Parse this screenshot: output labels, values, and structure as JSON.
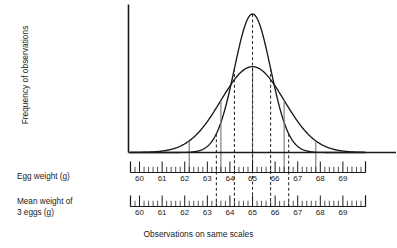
{
  "chart_data": {
    "type": "line",
    "title": "",
    "xlabel": "Observations on same scales",
    "ylabel": "Frequency of observations",
    "grid": false,
    "legend": "none",
    "xlim": [
      59.6,
      70.0
    ],
    "ylim": [
      0,
      1
    ],
    "axes": [
      {
        "name": "egg-weight-axis",
        "label": "Egg weight (g)",
        "tick_labels": [
          "60",
          "61",
          "62",
          "63",
          "64",
          "65",
          "66",
          "67",
          "68",
          "69"
        ],
        "tick_values": [
          60,
          61,
          62,
          63,
          64,
          65,
          66,
          67,
          68,
          69
        ],
        "minor_ticks_per_unit": 5,
        "range": [
          59.6,
          70.0
        ]
      },
      {
        "name": "mean-weight-axis",
        "label": "Mean weight of\n3 eggs (g)",
        "tick_labels": [
          "60",
          "61",
          "62",
          "63",
          "64",
          "65",
          "66",
          "67",
          "68",
          "69"
        ],
        "tick_values": [
          60,
          61,
          62,
          63,
          64,
          65,
          66,
          67,
          68,
          69
        ],
        "minor_ticks_per_unit": 5,
        "range": [
          59.6,
          70.0
        ]
      }
    ],
    "series": [
      {
        "name": "Distribution of individual egg weights",
        "style": "solid",
        "mean": 65.0,
        "sd": 1.4,
        "peak_height": 0.62,
        "note": "wider flatter normal curve"
      },
      {
        "name": "Distribution of mean weight of 3 eggs",
        "style": "solid",
        "mean": 65.0,
        "sd": 0.8,
        "peak_height": 1.0,
        "note": "narrower taller normal curve"
      }
    ],
    "reference_lines": [
      {
        "name": "egg-minus-2sd",
        "value": 62.2,
        "style": "solid",
        "color": "#7a7a7a"
      },
      {
        "name": "egg-minus-1sd",
        "value": 63.6,
        "style": "solid",
        "color": "#7a7a7a"
      },
      {
        "name": "egg-mean",
        "value": 65.0,
        "style": "solid",
        "color": "#7a7a7a"
      },
      {
        "name": "egg-plus-1sd",
        "value": 66.4,
        "style": "solid",
        "color": "#7a7a7a"
      },
      {
        "name": "egg-plus-2sd",
        "value": 67.8,
        "style": "solid",
        "color": "#7a7a7a"
      },
      {
        "name": "mean3-minus-2sd",
        "value": 63.4,
        "style": "dashed",
        "color": "#2b2b2b"
      },
      {
        "name": "mean3-minus-1sd",
        "value": 64.2,
        "style": "dashed",
        "color": "#2b2b2b"
      },
      {
        "name": "mean3-mean",
        "value": 65.0,
        "style": "dashed",
        "color": "#2b2b2b"
      },
      {
        "name": "mean3-plus-1sd",
        "value": 65.8,
        "style": "dashed",
        "color": "#2b2b2b"
      },
      {
        "name": "mean3-plus-2sd",
        "value": 66.6,
        "style": "dashed",
        "color": "#2b2b2b"
      }
    ]
  },
  "labels": {
    "y_axis": "Frequency of observations",
    "egg_weight": "Egg weight (g)",
    "mean_weight_line1": "Mean weight of",
    "mean_weight_line2": "3 eggs (g)",
    "caption": "Observations on same scales"
  },
  "colors": {
    "curve": "#1a1a1a",
    "axis": "#1a1a1a",
    "solid_marker": "#7a7a7a",
    "dashed_marker": "#2b2b2b",
    "text": "#1a1a1a",
    "background": "#ffffff"
  }
}
